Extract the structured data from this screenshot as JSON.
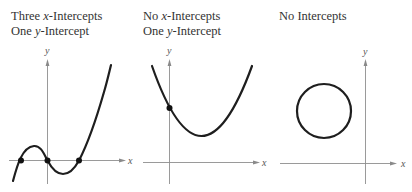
{
  "figure": {
    "panels": [
      {
        "id": "three-x-intercepts",
        "title_lines": [
          {
            "pre": "Three ",
            "var": "x",
            "post": "-Intercepts"
          },
          {
            "pre": "One ",
            "var": "y",
            "post": "-Intercept"
          }
        ],
        "axis_labels": {
          "x": "x",
          "y": "y"
        },
        "curve": "cubic",
        "intercept_points": 3
      },
      {
        "id": "no-x-intercepts",
        "title_lines": [
          {
            "pre": "No ",
            "var": "x",
            "post": "-Intercepts"
          },
          {
            "pre": "One ",
            "var": "y",
            "post": "-Intercept"
          }
        ],
        "axis_labels": {
          "x": "x",
          "y": "y"
        },
        "curve": "parabola",
        "intercept_points": 1
      },
      {
        "id": "no-intercepts",
        "title_lines": [
          {
            "pre": "No Intercepts",
            "var": "",
            "post": ""
          }
        ],
        "axis_labels": {
          "x": "x",
          "y": "y"
        },
        "curve": "circle",
        "intercept_points": 0
      }
    ],
    "colors": {
      "curve": "#1e1e1e",
      "axis": "#8a8a8a",
      "text": "#333333",
      "point": "#111111"
    }
  }
}
